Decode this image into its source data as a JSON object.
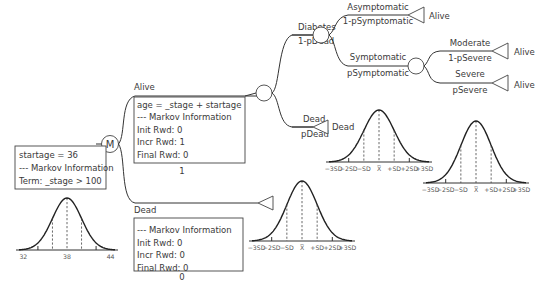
{
  "tree": {
    "markov_node": {
      "symbol": "M",
      "info_lines": [
        "startage = 36",
        "--- Markov Information",
        "Term: _stage > 100"
      ]
    },
    "alive_state": {
      "label": "Alive",
      "info_lines": [
        "age = _stage + startage",
        "--- Markov Information",
        "Init Rwd: 0",
        "Incr Rwd: 1",
        "Final Rwd: 0"
      ],
      "prob": "1"
    },
    "dead_state": {
      "label": "Dead",
      "info_lines": [
        "--- Markov Information",
        "Init Rwd: 0",
        "Incr Rwd: 0",
        "Final Rwd: 0"
      ],
      "prob": "0"
    },
    "diabetes_branch": {
      "label": "Diabetes",
      "prob": "1-pDead"
    },
    "dead_branch": {
      "label": "Dead",
      "prob": "pDead",
      "terminal": "Dead"
    },
    "asymptomatic_branch": {
      "label": "Asymptomatic",
      "prob": "1-pSymptomatic",
      "terminal": "Alive"
    },
    "symptomatic_branch": {
      "label": "Symptomatic",
      "prob": "pSymptomatic"
    },
    "moderate_branch": {
      "label": "Moderate",
      "prob": "1-pSevere",
      "terminal": "Alive"
    },
    "severe_branch": {
      "label": "Severe",
      "prob": "pSevere",
      "terminal": "Alive"
    }
  },
  "distributions": {
    "startage_dist": {
      "ticks": [
        "32",
        "38",
        "44"
      ]
    },
    "sd_ticks": [
      "−3SD",
      "−2SD",
      "−SD",
      "X̅",
      "+SD",
      "+2SD",
      "+3SD"
    ]
  }
}
